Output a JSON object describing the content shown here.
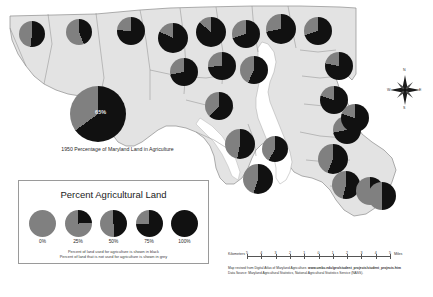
{
  "title_pie": {
    "value_label": "65%",
    "percent": 65,
    "caption": "1950 Percentage of Maryland Land in Agriculture"
  },
  "legend": {
    "title": "Percent Agricultural Land",
    "steps": [
      {
        "label": "0%",
        "percent": 0
      },
      {
        "label": "25%",
        "percent": 25
      },
      {
        "label": "50%",
        "percent": 50
      },
      {
        "label": "75%",
        "percent": 75
      },
      {
        "label": "100%",
        "percent": 100
      }
    ],
    "note_line1": "Percent of land used for agriculture is shown in black",
    "note_line2": "Percent of land that is not used for agriculture is shown in grey"
  },
  "scalebar": {
    "unit_left": "Kilometers",
    "unit_right": "Miles",
    "ticks": [
      "5",
      "4",
      "3",
      "2",
      "1",
      "0",
      "1",
      "2",
      "3",
      "4",
      "5"
    ]
  },
  "credits": {
    "line1_prefix": "Map revised from Digital Atlas of Maryland Agriculture.  ",
    "line1_url": "www.umbc.edu/geo/student_projects/student_projects.htm",
    "line2": "Data Source: Maryland Agricultural Statistics, National Agricultural Statistics Service (NASS)."
  },
  "compass": {
    "north": "N",
    "south": "S",
    "east": "E",
    "west": "W"
  },
  "colors": {
    "agriculture_black": "#111111",
    "non_agriculture_grey": "#808080",
    "land_fill": "#e3e3e3",
    "county_border": "#8d8d8d",
    "water": "#ffffff"
  },
  "counties": [
    {
      "name": "Garrett",
      "x": 19,
      "y": 21,
      "r": 13,
      "percent": 52
    },
    {
      "name": "Allegany",
      "x": 66,
      "y": 19,
      "r": 13,
      "percent": 44
    },
    {
      "name": "Washington",
      "x": 117,
      "y": 17,
      "r": 14,
      "percent": 76
    },
    {
      "name": "Frederick",
      "x": 158,
      "y": 23,
      "r": 15,
      "percent": 82
    },
    {
      "name": "Carroll",
      "x": 196,
      "y": 17,
      "r": 15,
      "percent": 86
    },
    {
      "name": "Baltimore",
      "x": 232,
      "y": 20,
      "r": 14,
      "percent": 70
    },
    {
      "name": "Harford",
      "x": 266,
      "y": 14,
      "r": 15,
      "percent": 72
    },
    {
      "name": "Cecil",
      "x": 304,
      "y": 17,
      "r": 14,
      "percent": 70
    },
    {
      "name": "Kent",
      "x": 325,
      "y": 52,
      "r": 14,
      "percent": 78
    },
    {
      "name": "Howard",
      "x": 208,
      "y": 52,
      "r": 14,
      "percent": 74
    },
    {
      "name": "Montgomery",
      "x": 170,
      "y": 58,
      "r": 14,
      "percent": 72
    },
    {
      "name": "Anne Arundel",
      "x": 240,
      "y": 56,
      "r": 14,
      "percent": 57
    },
    {
      "name": "Queen Annes",
      "x": 320,
      "y": 86,
      "r": 14,
      "percent": 80
    },
    {
      "name": "Prince Georges",
      "x": 205,
      "y": 92,
      "r": 14,
      "percent": 62
    },
    {
      "name": "Talbot",
      "x": 333,
      "y": 116,
      "r": 14,
      "percent": 72
    },
    {
      "name": "Caroline",
      "x": 341,
      "y": 104,
      "r": 14,
      "percent": 80
    },
    {
      "name": "Charles",
      "x": 225,
      "y": 129,
      "r": 15,
      "percent": 53
    },
    {
      "name": "Calvert",
      "x": 262,
      "y": 136,
      "r": 13,
      "percent": 58
    },
    {
      "name": "Dorchester",
      "x": 318,
      "y": 144,
      "r": 15,
      "percent": 56
    },
    {
      "name": "St Marys",
      "x": 243,
      "y": 164,
      "r": 15,
      "percent": 55
    },
    {
      "name": "Wicomico",
      "x": 332,
      "y": 171,
      "r": 14,
      "percent": 54
    },
    {
      "name": "Somerset",
      "x": 356,
      "y": 177,
      "r": 14,
      "percent": 47
    },
    {
      "name": "Worcester",
      "x": 368,
      "y": 182,
      "r": 14,
      "percent": 50
    }
  ]
}
